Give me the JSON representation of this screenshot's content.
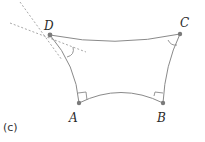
{
  "figure": {
    "caption": "(c)",
    "colors": {
      "curve": "#8a8a8a",
      "dashed": "#a8a8a8",
      "point": "#7a7a7a",
      "label": "#2a2a2a"
    },
    "vertices": [
      {
        "id": "D",
        "label": "D"
      },
      {
        "id": "C",
        "label": "C"
      },
      {
        "id": "A",
        "label": "A"
      },
      {
        "id": "B",
        "label": "B"
      }
    ],
    "edges": [
      {
        "from": "D",
        "to": "C",
        "style": "curved"
      },
      {
        "from": "D",
        "to": "A",
        "style": "curved"
      },
      {
        "from": "C",
        "to": "B",
        "style": "curved"
      },
      {
        "from": "A",
        "to": "B",
        "style": "curved"
      }
    ],
    "angle_marks": [
      {
        "at": "A",
        "type": "right-angle"
      },
      {
        "at": "B",
        "type": "right-angle"
      },
      {
        "at": "C",
        "type": "arc"
      },
      {
        "at": "D",
        "type": "arc"
      }
    ],
    "tangent_lines_at": "D"
  }
}
